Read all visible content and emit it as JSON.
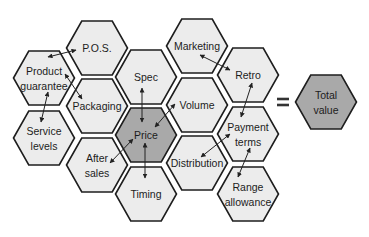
{
  "diagram": {
    "colors": {
      "light_fill": "#ececec",
      "dark_fill": "#a9a9a9",
      "stroke": "#1e1e1e"
    },
    "hexagons": [
      {
        "id": "pos",
        "lines": [
          "P.O.S."
        ],
        "cx": 97,
        "cy": 48,
        "dark": false
      },
      {
        "id": "product-guarantee",
        "lines": [
          "Product",
          "guarantee"
        ],
        "cx": 44,
        "cy": 78,
        "dark": false
      },
      {
        "id": "packaging",
        "lines": [
          "Packaging"
        ],
        "cx": 97,
        "cy": 106,
        "dark": false
      },
      {
        "id": "service-levels",
        "lines": [
          "Service",
          "levels"
        ],
        "cx": 44,
        "cy": 138,
        "dark": false
      },
      {
        "id": "after-sales",
        "lines": [
          "After",
          "sales"
        ],
        "cx": 97,
        "cy": 165,
        "dark": false
      },
      {
        "id": "spec",
        "lines": [
          "Spec"
        ],
        "cx": 146,
        "cy": 77,
        "dark": false
      },
      {
        "id": "price",
        "lines": [
          "Price"
        ],
        "cx": 146,
        "cy": 135,
        "dark": true
      },
      {
        "id": "timing",
        "lines": [
          "Timing"
        ],
        "cx": 146,
        "cy": 194,
        "dark": false
      },
      {
        "id": "marketing",
        "lines": [
          "Marketing"
        ],
        "cx": 197,
        "cy": 46,
        "dark": false
      },
      {
        "id": "volume",
        "lines": [
          "Volume"
        ],
        "cx": 197,
        "cy": 105,
        "dark": false
      },
      {
        "id": "distribution",
        "lines": [
          "Distribution"
        ],
        "cx": 197,
        "cy": 163,
        "dark": false
      },
      {
        "id": "retro",
        "lines": [
          "Retro"
        ],
        "cx": 248,
        "cy": 75,
        "dark": false
      },
      {
        "id": "payment-terms",
        "lines": [
          "Payment",
          "terms"
        ],
        "cx": 248,
        "cy": 134,
        "dark": false
      },
      {
        "id": "range-allowance",
        "lines": [
          "Range",
          "allowance"
        ],
        "cx": 248,
        "cy": 194,
        "dark": false
      },
      {
        "id": "total-value",
        "lines": [
          "Total",
          "value"
        ],
        "cx": 326,
        "cy": 102,
        "dark": true
      }
    ],
    "equals_sign": {
      "symbol": "=",
      "x": 283,
      "y": 102
    },
    "arrows": [
      {
        "from": "product-guarantee",
        "to": "pos",
        "x1": 48,
        "y1": 57,
        "x2": 76,
        "y2": 50
      },
      {
        "from": "product-guarantee",
        "to": "packaging",
        "x1": 65,
        "y1": 74,
        "x2": 82,
        "y2": 99
      },
      {
        "from": "product-guarantee",
        "to": "service-levels",
        "x1": 48,
        "y1": 92,
        "x2": 41,
        "y2": 122
      },
      {
        "from": "spec",
        "to": "price",
        "x1": 142,
        "y1": 88,
        "x2": 142,
        "y2": 122
      },
      {
        "from": "price",
        "to": "volume",
        "x1": 155,
        "y1": 127,
        "x2": 175,
        "y2": 104
      },
      {
        "from": "price",
        "to": "after-sales",
        "x1": 133,
        "y1": 139,
        "x2": 110,
        "y2": 163
      },
      {
        "from": "price",
        "to": "timing",
        "x1": 145,
        "y1": 143,
        "x2": 145,
        "y2": 178
      },
      {
        "from": "marketing",
        "to": "retro",
        "x1": 200,
        "y1": 55,
        "x2": 230,
        "y2": 70
      },
      {
        "from": "retro",
        "to": "payment-terms",
        "x1": 252,
        "y1": 83,
        "x2": 241,
        "y2": 117
      },
      {
        "from": "distribution",
        "to": "payment-terms",
        "x1": 201,
        "y1": 157,
        "x2": 230,
        "y2": 134
      },
      {
        "from": "payment-terms",
        "to": "range-allowance",
        "x1": 250,
        "y1": 148,
        "x2": 238,
        "y2": 177
      }
    ]
  }
}
